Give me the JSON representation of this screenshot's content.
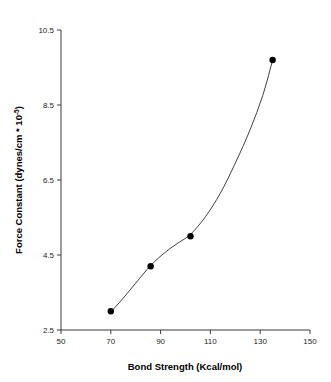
{
  "chart_data": {
    "type": "scatter",
    "title": "",
    "subtitle": "",
    "xlabel": "Bond Strength (Kcal/mol)",
    "ylabel": "Force Constant (dynes/cm * 10",
    "ylabel_superscript": "-5",
    "ylabel_suffix": ")",
    "xlim": [
      50,
      150
    ],
    "ylim": [
      2.5,
      10.5
    ],
    "xticks": [
      50,
      70,
      90,
      110,
      130,
      150
    ],
    "yticks": [
      2.5,
      4.5,
      6.5,
      8.5,
      10.5
    ],
    "xtick_labels": [
      "50",
      "70",
      "90",
      "110",
      "130",
      "150"
    ],
    "ytick_labels": [
      "2.5",
      "4.5",
      "6.5",
      "8.5",
      "10.5"
    ],
    "grid": false,
    "legend": "none",
    "series": [
      {
        "name": "Force constant vs bond strength",
        "marker": "filled-circle",
        "marker_color": "#000000",
        "line_color": "#2b2b2b",
        "fitted_curve": true,
        "x": [
          70,
          86,
          102,
          135
        ],
        "y": [
          3.0,
          4.2,
          5.0,
          9.7
        ],
        "points": [
          {
            "x": 70,
            "y": 3.0
          },
          {
            "x": 86,
            "y": 4.2
          },
          {
            "x": 102,
            "y": 5.0
          },
          {
            "x": 135,
            "y": 9.7
          }
        ]
      }
    ],
    "curve_path_points": [
      {
        "x": 70,
        "y": 2.98
      },
      {
        "x": 75,
        "y": 3.35
      },
      {
        "x": 80,
        "y": 3.75
      },
      {
        "x": 86,
        "y": 4.22
      },
      {
        "x": 92,
        "y": 4.58
      },
      {
        "x": 97,
        "y": 4.82
      },
      {
        "x": 102,
        "y": 5.05
      },
      {
        "x": 108,
        "y": 5.52
      },
      {
        "x": 114,
        "y": 6.15
      },
      {
        "x": 120,
        "y": 6.95
      },
      {
        "x": 126,
        "y": 7.85
      },
      {
        "x": 131,
        "y": 8.75
      },
      {
        "x": 135,
        "y": 9.7
      }
    ]
  },
  "colors": {
    "background": "#ffffff",
    "axis": "#3a3a3a",
    "text": "#000000",
    "marker": "#000000",
    "curve": "#2b2b2b"
  }
}
